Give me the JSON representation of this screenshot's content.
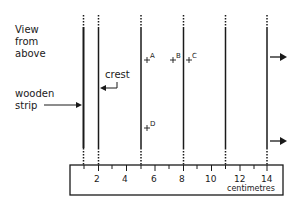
{
  "labels": {
    "view_line1": "View",
    "view_line2": "from",
    "view_line3": "above",
    "wooden_line1": "wooden",
    "wooden_line2": "strip",
    "crest": "crest",
    "unit": "centimetres"
  },
  "points": [
    {
      "id": "A",
      "x_cm": 5.3
    },
    {
      "id": "B",
      "x_cm": 7.4
    },
    {
      "id": "C",
      "x_cm": 8.4
    },
    {
      "id": "D",
      "x_cm": 5.3
    }
  ],
  "wave_crests_cm": [
    1,
    2,
    5,
    8,
    11,
    14
  ],
  "ruler": {
    "tick_labels": [
      "2",
      "4",
      "6",
      "8",
      "10",
      "12",
      "14"
    ],
    "min_cm": 0,
    "max_cm": 15
  },
  "colors": {
    "line": "#1a1a1a",
    "background": "#ffffff"
  }
}
